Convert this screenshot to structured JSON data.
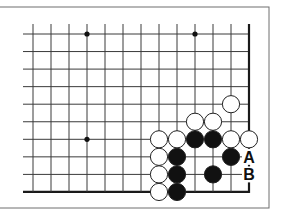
{
  "diagram": {
    "type": "go-board-problem",
    "frame": {
      "top": 7,
      "right": 269,
      "bottom": 208,
      "left": -2,
      "color": "#6e6e6e"
    },
    "grid": {
      "x0": 33,
      "dx": 18,
      "cols": 13,
      "y0": 34,
      "dy": 17.55,
      "rows": 10,
      "left_extent": 23,
      "line_color": "#3a3a3a",
      "edge_color": "#1a1a1a",
      "right_edge": true,
      "bottom_edge": true
    },
    "star_points": [
      {
        "col": 3,
        "row": 0
      },
      {
        "col": 9,
        "row": 0
      },
      {
        "col": 3,
        "row": 6
      }
    ],
    "stones": [
      {
        "color": "white",
        "col": 11,
        "row": 4
      },
      {
        "color": "white",
        "col": 9,
        "row": 5
      },
      {
        "color": "white",
        "col": 10,
        "row": 5
      },
      {
        "color": "white",
        "col": 7,
        "row": 6
      },
      {
        "color": "white",
        "col": 8,
        "row": 6
      },
      {
        "color": "black",
        "col": 9,
        "row": 6
      },
      {
        "color": "black",
        "col": 10,
        "row": 6
      },
      {
        "color": "white",
        "col": 11,
        "row": 6
      },
      {
        "color": "white",
        "col": 12,
        "row": 6
      },
      {
        "color": "white",
        "col": 7,
        "row": 7
      },
      {
        "color": "black",
        "col": 8,
        "row": 7
      },
      {
        "color": "black",
        "col": 11,
        "row": 7
      },
      {
        "color": "white",
        "col": 7,
        "row": 8
      },
      {
        "color": "black",
        "col": 8,
        "row": 8
      },
      {
        "color": "black",
        "col": 10,
        "row": 8
      },
      {
        "color": "white",
        "col": 7,
        "row": 9
      },
      {
        "color": "black",
        "col": 8,
        "row": 9
      }
    ],
    "labels": [
      {
        "text": "A",
        "col": 12,
        "row": 7
      },
      {
        "text": "B",
        "col": 12,
        "row": 8
      }
    ],
    "colors": {
      "black_stone": "#111111",
      "white_stone": "#ffffff",
      "stone_outline": "#222222",
      "label": "#111111"
    }
  }
}
